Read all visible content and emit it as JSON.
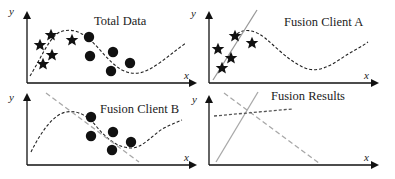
{
  "panels": [
    {
      "title": "Total Data",
      "x_label": "x",
      "y_label": "y",
      "stars": [
        [
          40,
          45
        ],
        [
          51,
          35
        ],
        [
          43,
          64
        ],
        [
          52,
          55
        ],
        [
          72,
          40
        ]
      ],
      "dots": [
        [
          89,
          37
        ],
        [
          90,
          56
        ],
        [
          113,
          52
        ],
        [
          111,
          71
        ],
        [
          130,
          63
        ]
      ],
      "curve": "M30,76 C40,60 48,40 58,33 C68,28 78,30 88,38 C100,48 108,62 122,70 C136,77 146,72 158,64 C168,57 176,50 186,43",
      "lines": []
    },
    {
      "title": "Fusion Client A",
      "x_label": "x",
      "y_label": "y",
      "stars": [
        [
          218,
          49
        ],
        [
          235,
          36
        ],
        [
          231,
          58
        ],
        [
          222,
          68
        ],
        [
          252,
          43
        ]
      ],
      "dots": [],
      "curve": "M237,34 C245,28 255,30 265,38 C277,48 290,62 305,68 C318,73 330,66 342,58 C352,51 360,48 368,42",
      "lines": [
        {
          "d": "M213,80 L257,10",
          "color": "#999999",
          "dash": ""
        }
      ]
    },
    {
      "title": "Fusion Client B",
      "x_label": "x",
      "y_label": "y",
      "stars": [],
      "dots": [
        [
          91,
          117
        ],
        [
          91,
          136
        ],
        [
          113,
          132
        ],
        [
          112,
          150
        ],
        [
          131,
          142
        ]
      ],
      "curve": "M31,152 C40,134 52,115 66,112 C78,110 88,116 96,126 C106,138 116,147 130,148 C142,149 152,135 164,128 C172,124 177,122 182,120",
      "lines": [
        {
          "d": "M46,93 L139,162",
          "color": "#a8a8a8",
          "dash": "5,3"
        }
      ]
    },
    {
      "title": "Fusion Results",
      "x_label": "x",
      "y_label": "y",
      "stars": [],
      "dots": [],
      "curve": "",
      "lines": [
        {
          "d": "M216,162 L258,92",
          "color": "#a8a8a8",
          "dash": ""
        },
        {
          "d": "M224,93 L319,163",
          "color": "#a8a8a8",
          "dash": "5,3"
        },
        {
          "d": "M214,116 L292,109",
          "color": "#555555",
          "dash": "3,2"
        }
      ]
    }
  ],
  "axes": [
    {
      "ox": 27,
      "oy": 83,
      "xend": 195,
      "ytop": 13,
      "title_x": 120,
      "title_y": 24,
      "xl": [
        184,
        79
      ],
      "yl": [
        17,
        15
      ]
    },
    {
      "ox": 209,
      "oy": 83,
      "xend": 377,
      "ytop": 13,
      "title_x": 323,
      "title_y": 27,
      "xl": [
        364,
        79
      ],
      "yl": [
        199,
        17
      ]
    },
    {
      "ox": 27,
      "oy": 165,
      "xend": 195,
      "ytop": 95,
      "title_x": 137,
      "title_y": 113,
      "xl": [
        184,
        161
      ],
      "yl": [
        17,
        101
      ]
    },
    {
      "ox": 209,
      "oy": 165,
      "xend": 377,
      "ytop": 97,
      "title_x": 301,
      "title_y": 100,
      "xl": [
        364,
        161
      ],
      "yl": [
        200,
        103
      ]
    }
  ]
}
